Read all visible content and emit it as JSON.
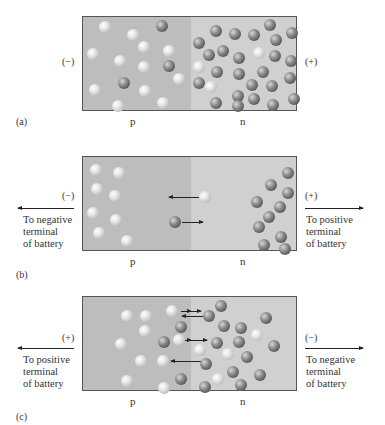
{
  "figure": {
    "panels": [
      {
        "id": "a",
        "caption": "(a)",
        "left_sign": "(−)",
        "right_sign": "(+)",
        "p_label": "p",
        "n_label": "n",
        "description": "Unbiased p-n junction: holes and few electrons in p region, many electrons and few holes in n region"
      },
      {
        "id": "b",
        "caption": "(b)",
        "left_sign": "(−)",
        "right_sign": "(+)",
        "left_terminal": [
          "To negative",
          "terminal",
          "of battery"
        ],
        "right_terminal": [
          "To positive",
          "terminal",
          "of battery"
        ],
        "p_label": "p",
        "n_label": "n",
        "description": "Reverse bias: carriers pulled away from junction"
      },
      {
        "id": "c",
        "caption": "(c)",
        "left_sign": "(+)",
        "right_sign": "(−)",
        "left_terminal": [
          "To positive",
          "terminal",
          "of battery"
        ],
        "right_terminal": [
          "To negative",
          "terminal",
          "of battery"
        ],
        "p_label": "p",
        "n_label": "n",
        "description": "Forward bias: carriers crossing the junction"
      }
    ],
    "legend": {
      "hole": "light sphere (hole)",
      "electron": "dark sphere (electron)"
    },
    "colors": {
      "p_region": "#bdbdbd",
      "n_region": "#d0d0d0",
      "border": "#555555"
    }
  }
}
